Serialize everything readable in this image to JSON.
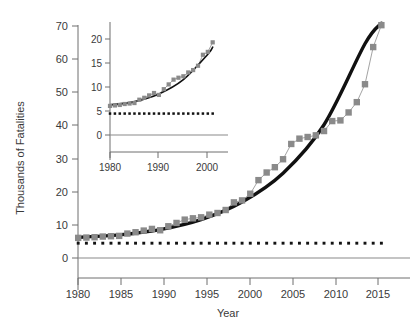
{
  "figure": {
    "background_color": "#ffffff",
    "marker_color": "#8a8a8a",
    "fit_color": "#111111",
    "reference_color": "#121212",
    "axis_color": "#6e6e6e"
  },
  "main_axes": {
    "xlabel": "Year",
    "ylabel": "Thousands of Fatalities",
    "x_ticks": [
      "1980",
      "1985",
      "1990",
      "1995",
      "2000",
      "2005",
      "2010",
      "2015"
    ],
    "y_ticks": [
      "0",
      "10",
      "20",
      "30",
      "40",
      "50",
      "60",
      "70"
    ]
  },
  "inset_axes": {
    "x_ticks": [
      "1980",
      "1990",
      "2000"
    ],
    "y_ticks": [
      "0",
      "5",
      "10",
      "15",
      "20"
    ]
  },
  "chart_data": {
    "type": "line",
    "title": "",
    "xlabel": "Year",
    "ylabel": "Thousands of Fatalities",
    "xlim": [
      1979,
      2017.6
    ],
    "ylim": [
      -4,
      72
    ],
    "grid": false,
    "legend_position": "none",
    "annotations": [
      "Inset panel replots the 1980-2001 portion of the same series on an expanded vertical scale (0-20 thousand).",
      "Dotted horizontal line marks a constant reference level of about 4.5 thousand fatalities."
    ],
    "series": [
      {
        "name": "Observed fatalities (gray squares, thin connector)",
        "marker": "square",
        "marker_color": "#8a8a8a",
        "x": [
          1980,
          1981,
          1982,
          1983,
          1984,
          1985,
          1986,
          1987,
          1988,
          1989,
          1990,
          1991,
          1992,
          1993,
          1994,
          1995,
          1996,
          1997,
          1998,
          1999,
          2000,
          2001,
          2002,
          2003,
          2004,
          2005,
          2006,
          2007,
          2008,
          2009,
          2010,
          2011,
          2012,
          2013,
          2014,
          2015,
          2016,
          2017
        ],
        "values": [
          6.1,
          6.2,
          6.3,
          6.5,
          6.6,
          6.7,
          7.4,
          7.8,
          8.3,
          8.8,
          8.4,
          9.6,
          10.6,
          11.6,
          12.0,
          12.3,
          13.1,
          13.6,
          14.5,
          16.8,
          17.4,
          19.4,
          23.5,
          25.8,
          27.4,
          29.8,
          34.4,
          36.0,
          36.5,
          37.0,
          38.3,
          41.3,
          41.5,
          43.9,
          47.0,
          52.4,
          63.6,
          70.2
        ]
      },
      {
        "name": "Exponential fit (thick black curve)",
        "marker": "none",
        "marker_color": "#111111",
        "x": [
          1980,
          1985,
          1990,
          1995,
          2000,
          2005,
          2010,
          2015,
          2017
        ],
        "values": [
          6.3,
          7.0,
          8.6,
          11.6,
          16.9,
          25.6,
          40.2,
          64.6,
          70.8
        ]
      },
      {
        "name": "Reference level (dotted line)",
        "marker": "dot",
        "marker_color": "#121212",
        "x": [
          1980,
          2017
        ],
        "values": [
          4.5,
          4.5
        ]
      }
    ],
    "inset": {
      "type": "line",
      "xlim": [
        1979.2,
        2001.8
      ],
      "ylim": [
        -2.2,
        21.5
      ],
      "x_ticks": [
        1980,
        1990,
        2000
      ],
      "y_ticks": [
        0,
        5,
        10,
        15,
        20
      ],
      "series": [
        {
          "name": "Observed fatalities 1980-2001",
          "marker": "square",
          "x": [
            1980,
            1981,
            1982,
            1983,
            1984,
            1985,
            1986,
            1987,
            1988,
            1989,
            1990,
            1991,
            1992,
            1993,
            1994,
            1995,
            1996,
            1997,
            1998,
            1999,
            2000,
            2001
          ],
          "values": [
            6.1,
            6.2,
            6.3,
            6.5,
            6.6,
            6.7,
            7.4,
            7.8,
            8.3,
            8.8,
            8.4,
            9.6,
            10.6,
            11.6,
            12.0,
            12.3,
            13.1,
            13.6,
            14.5,
            16.8,
            17.4,
            19.4
          ]
        },
        {
          "name": "Exponential fit 1980-2001",
          "marker": "none",
          "x": [
            1980,
            1985,
            1990,
            1995,
            2000,
            2001
          ],
          "values": [
            6.3,
            7.0,
            8.6,
            11.6,
            16.9,
            18.4
          ]
        },
        {
          "name": "Reference level (dotted line)",
          "marker": "dot",
          "x": [
            1980,
            2001
          ],
          "values": [
            4.5,
            4.5
          ]
        }
      ]
    }
  }
}
